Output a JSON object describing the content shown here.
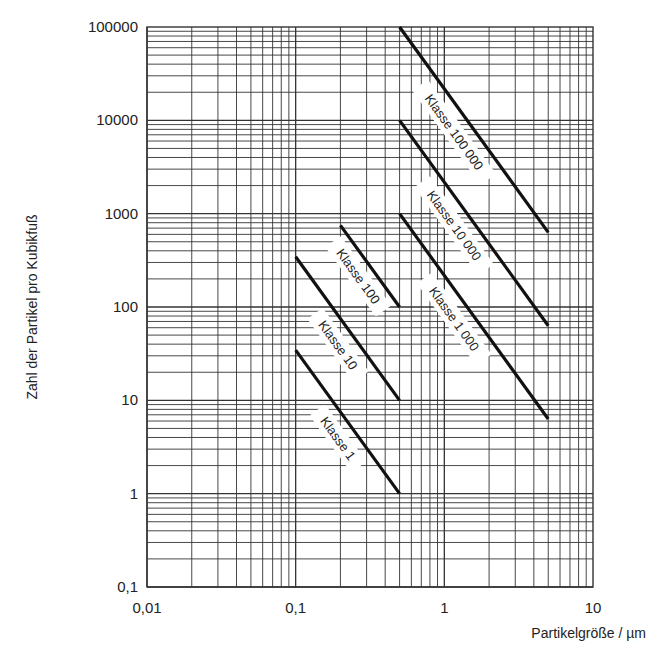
{
  "chart_data": {
    "type": "line",
    "title": "",
    "xlabel": "Partikelgröße / µm",
    "ylabel": "Zahl der Partikel pro Kubikfuß",
    "xscale": "log",
    "yscale": "log",
    "xlim": [
      0.01,
      10
    ],
    "ylim": [
      0.1,
      100000
    ],
    "grid": true,
    "legend": "inline labels along lines",
    "x_ticks": [
      "0,01",
      "0,1",
      "1",
      "10"
    ],
    "x_tick_values": [
      0.01,
      0.1,
      1,
      10
    ],
    "y_ticks": [
      "0,1",
      "1",
      "10",
      "100",
      "1000",
      "10000",
      "100000"
    ],
    "y_tick_values": [
      0.1,
      1,
      10,
      100,
      1000,
      10000,
      100000
    ],
    "series": [
      {
        "name": "Klasse 1",
        "class": 1,
        "x": [
          0.1,
          0.5
        ],
        "y": [
          34.5,
          1
        ]
      },
      {
        "name": "Klasse 10",
        "class": 10,
        "x": [
          0.1,
          0.5
        ],
        "y": [
          345,
          10
        ]
      },
      {
        "name": "Klasse 100",
        "class": 100,
        "x": [
          0.2,
          0.5
        ],
        "y": [
          750,
          100
        ]
      },
      {
        "name": "Klasse 1 000",
        "class": 1000,
        "x": [
          0.5,
          5
        ],
        "y": [
          1000,
          6.3
        ]
      },
      {
        "name": "Klasse 10 000",
        "class": 10000,
        "x": [
          0.5,
          5
        ],
        "y": [
          10000,
          63
        ]
      },
      {
        "name": "Klasse 100 000",
        "class": 100000,
        "x": [
          0.5,
          5
        ],
        "y": [
          100000,
          631
        ]
      }
    ],
    "line_slope_exponent": -2.2
  },
  "colors": {
    "background": "#ffffff",
    "grid": "#333333",
    "line": "#111111",
    "text": "#222222"
  }
}
